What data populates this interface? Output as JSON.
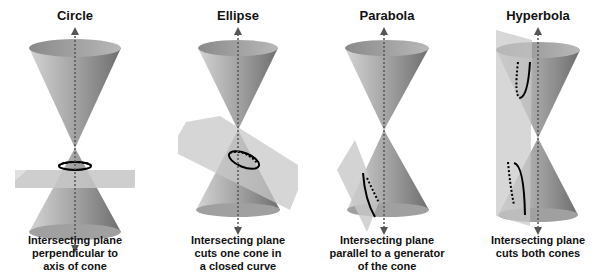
{
  "figure": {
    "panels": [
      {
        "title": "Circle",
        "caption": [
          "Intersecting plane",
          "perpendicular to",
          "axis of cone"
        ]
      },
      {
        "title": "Ellipse",
        "caption": [
          "Intersecting plane",
          "cuts one cone in",
          "a closed curve"
        ]
      },
      {
        "title": "Parabola",
        "caption": [
          "Intersecting plane",
          "parallel to a generator",
          "of the cone"
        ]
      },
      {
        "title": "Hyperbola",
        "caption": [
          "Intersecting plane",
          "cuts both cones"
        ]
      }
    ],
    "colors": {
      "cone_light": "#d0d0d0",
      "cone_dark": "#7a7a7a",
      "plane": "#c8c8c8",
      "curve": "#000000",
      "axis": "#555555"
    }
  }
}
